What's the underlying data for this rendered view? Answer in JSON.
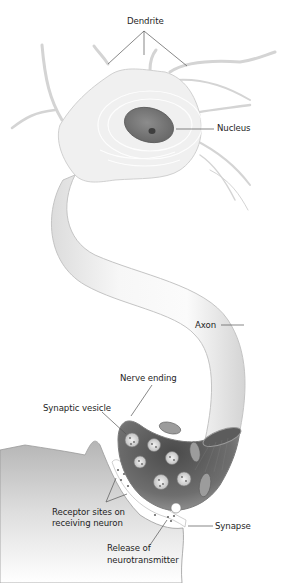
{
  "diagram": {
    "labels": {
      "dendrite": "Dendrite",
      "nucleus": "Nucleus",
      "axon": "Axon",
      "nerve_ending": "Nerve ending",
      "synaptic_vesicle": "Synaptic vesicle",
      "receptor_sites_line1": "Receptor sites on",
      "receptor_sites_line2": "receiving neuron",
      "synapse": "Synapse",
      "release_line1": "Release of",
      "release_line2": "neurotransmitter"
    },
    "colors": {
      "background": "#ffffff",
      "cell_body": "#efefef",
      "cell_outline": "#c8c8c8",
      "nucleus": "#7a7a7a",
      "terminal_interior": "#5a5a5a",
      "vesicle": "#d9d9d9",
      "leader_line": "#555555",
      "label_text": "#1e1e1e"
    }
  }
}
